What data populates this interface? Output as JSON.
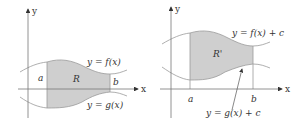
{
  "colors": {
    "axis": "#777777",
    "curve": "#9a9a9a",
    "shade": "#cfcfcf",
    "text": "#333333"
  },
  "left_figure": {
    "axis_x_label": "x",
    "axis_y_label": "y",
    "region_label": "R",
    "bound_a_label": "a",
    "bound_b_label": "b",
    "top_curve_label": "y = f(x)",
    "bottom_curve_label": "y = g(x)"
  },
  "right_figure": {
    "axis_x_label": "x",
    "axis_y_label": "y",
    "region_label": "R'",
    "bound_a_label": "a",
    "bound_b_label": "b",
    "top_curve_label": "y = f(x) + c",
    "bottom_curve_label": "y = g(x) + c"
  }
}
